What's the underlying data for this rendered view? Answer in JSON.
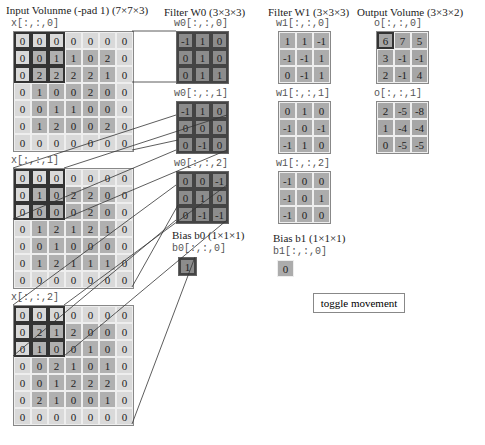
{
  "titles": {
    "input": "Input Volunme (-pad 1) (7×7×3)",
    "w0": "Filter W0 (3×3×3)",
    "w1": "Filter W1 (3×3×3)",
    "output": "Output Volume (3×3×2)",
    "b0": "Bias b0 (1×1×1)",
    "b1": "Bias b1 (1×1×1)"
  },
  "input": {
    "labels": [
      "x[:,:,0]",
      "x[:,:,1]",
      "x[:,:,2]"
    ],
    "slices": [
      [
        [
          0,
          0,
          0,
          0,
          0,
          0,
          0
        ],
        [
          0,
          0,
          1,
          1,
          0,
          2,
          0
        ],
        [
          0,
          2,
          2,
          2,
          2,
          1,
          0
        ],
        [
          0,
          1,
          0,
          0,
          2,
          0,
          0
        ],
        [
          0,
          0,
          1,
          1,
          0,
          0,
          0
        ],
        [
          0,
          1,
          2,
          0,
          0,
          2,
          0
        ],
        [
          0,
          0,
          0,
          0,
          0,
          0,
          0
        ]
      ],
      [
        [
          0,
          0,
          0,
          0,
          0,
          0,
          0
        ],
        [
          0,
          1,
          0,
          2,
          2,
          0,
          0
        ],
        [
          0,
          0,
          0,
          0,
          2,
          0,
          0
        ],
        [
          0,
          1,
          2,
          1,
          2,
          1,
          0
        ],
        [
          0,
          0,
          1,
          0,
          0,
          0,
          0
        ],
        [
          0,
          1,
          2,
          1,
          1,
          1,
          0
        ],
        [
          0,
          0,
          0,
          0,
          0,
          0,
          0
        ]
      ],
      [
        [
          0,
          0,
          0,
          0,
          0,
          0,
          0
        ],
        [
          0,
          2,
          1,
          2,
          0,
          0,
          0
        ],
        [
          0,
          1,
          0,
          0,
          1,
          0,
          0
        ],
        [
          0,
          0,
          2,
          1,
          0,
          1,
          0
        ],
        [
          0,
          0,
          1,
          2,
          2,
          2,
          0
        ],
        [
          0,
          2,
          1,
          0,
          0,
          1,
          0
        ],
        [
          0,
          0,
          0,
          0,
          0,
          0,
          0
        ]
      ]
    ]
  },
  "w0": {
    "labels": [
      "w0[:,:,0]",
      "w0[:,:,1]",
      "w0[:,:,2]"
    ],
    "slices": [
      [
        [
          -1,
          1,
          0
        ],
        [
          0,
          1,
          0
        ],
        [
          0,
          1,
          1
        ]
      ],
      [
        [
          -1,
          1,
          0
        ],
        [
          0,
          0,
          0
        ],
        [
          0,
          -1,
          0
        ]
      ],
      [
        [
          0,
          0,
          -1
        ],
        [
          0,
          1,
          0
        ],
        [
          0,
          -1,
          -1
        ]
      ]
    ]
  },
  "w1": {
    "labels": [
      "w1[:,:,0]",
      "w1[:,:,1]",
      "w1[:,:,2]"
    ],
    "slices": [
      [
        [
          1,
          1,
          -1
        ],
        [
          -1,
          -1,
          1
        ],
        [
          0,
          -1,
          1
        ]
      ],
      [
        [
          0,
          1,
          0
        ],
        [
          -1,
          0,
          -1
        ],
        [
          -1,
          1,
          0
        ]
      ],
      [
        [
          -1,
          0,
          0
        ],
        [
          -1,
          0,
          1
        ],
        [
          -1,
          0,
          0
        ]
      ]
    ]
  },
  "b0": {
    "label": "b0[:,:,0]",
    "value": "1"
  },
  "b1": {
    "label": "b1[:,:,0]",
    "value": "0"
  },
  "output": {
    "labels": [
      "o[:,:,0]",
      "o[:,:,1]"
    ],
    "slices": [
      [
        [
          6,
          7,
          5
        ],
        [
          3,
          -1,
          -1
        ],
        [
          2,
          -1,
          4
        ]
      ],
      [
        [
          2,
          -5,
          -8
        ],
        [
          1,
          -4,
          -4
        ],
        [
          0,
          -5,
          -5
        ]
      ]
    ]
  },
  "toggle_button": "toggle movement"
}
